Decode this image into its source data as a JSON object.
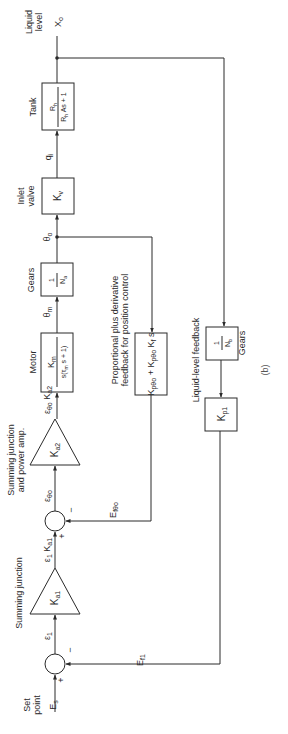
{
  "diagram": {
    "type": "block-diagram",
    "orientation": "rotated-90-ccw",
    "title_caption": "(b)",
    "colors": {
      "line": "#2a2a2a",
      "background": "#ffffff"
    },
    "input": {
      "label_line1": "Set",
      "label_line2": "point",
      "signal": "E",
      "signal_sub": "s"
    },
    "output": {
      "label_line1": "Liquid",
      "label_line2": "level",
      "signal": "X",
      "signal_sub": "o"
    },
    "junction1": {
      "plus": "+",
      "minus": "−",
      "feedback_signal": "E",
      "feedback_sub": "f1",
      "out_signal": "ε",
      "out_sub": "1"
    },
    "amp1": {
      "caption": "Summing junction",
      "gain": "K",
      "gain_sub": "a1",
      "out_signal": "ε",
      "out_sub": "1",
      "out_gain": "K",
      "out_gain_sub": "a1"
    },
    "junction2": {
      "plus": "+",
      "minus": "−",
      "feedback_signal": "E",
      "feedback_sub": "fθo",
      "out_signal": "ε",
      "out_sub": "θo"
    },
    "amp2": {
      "caption_line1": "Summing junction",
      "caption_line2": "and power amp.",
      "gain": "K",
      "gain_sub": "a2",
      "out_signal": "ε",
      "out_sub": "θo",
      "out_gain": "K",
      "out_gain_sub": "a2"
    },
    "motor": {
      "caption": "Motor",
      "numerator": "K",
      "numerator_sub": "m",
      "denominator": "s(τ",
      "denominator_sub": "m",
      "denominator_tail": " s + 1)",
      "out_signal": "θ",
      "out_sub": "m"
    },
    "gears_a": {
      "caption": "Gears",
      "numerator": "1",
      "denominator": "N",
      "denominator_sub": "a",
      "out_signal": "θ",
      "out_sub": "o"
    },
    "inlet_valve": {
      "caption_line1": "Inlet",
      "caption_line2": "valve",
      "gain": "K",
      "gain_sub": "v",
      "out_signal": "q",
      "out_sub": "i"
    },
    "tank": {
      "caption": "Tank",
      "numerator": "R",
      "numerator_sub": "h",
      "denominator": "R",
      "denominator_sub": "h",
      "denominator_tail": " As + 1"
    },
    "position_feedback": {
      "caption_line1": "Proportional plus derivative",
      "caption_line2": "feedback for position control",
      "term1": "K",
      "term1_sub": "pθo",
      "plus": " + ",
      "term2": "K",
      "term2_sub": "pθo",
      "term2_tail": " K",
      "term2_tail_sub": "f",
      "term2_s": " s"
    },
    "level_feedback": {
      "caption": "Liquid-level feedback",
      "gears_caption": "Gears",
      "gears_numerator": "1",
      "gears_denominator": "N",
      "gears_denominator_sub": "b",
      "gain": "K",
      "gain_sub": "p1"
    }
  }
}
